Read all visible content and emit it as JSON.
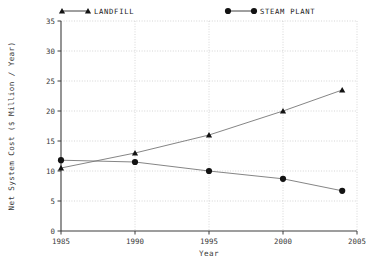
{
  "chart_data": {
    "type": "line",
    "title": "",
    "xlabel": "Year",
    "ylabel": "Net System Cost ($ Million / Year)",
    "x": [
      1985,
      1990,
      1995,
      2000,
      2004
    ],
    "xlim": [
      1985,
      2005
    ],
    "ylim": [
      0,
      35
    ],
    "xticks": [
      "1985",
      "1990",
      "1995",
      "2000",
      "2005"
    ],
    "xtick_values": [
      1985,
      1990,
      1995,
      2000,
      2005
    ],
    "yticks": [
      "0",
      "5",
      "10",
      "15",
      "20",
      "25",
      "30",
      "35"
    ],
    "ytick_values": [
      0,
      5,
      10,
      15,
      20,
      25,
      30,
      35
    ],
    "grid": true,
    "legend_position": "top",
    "series": [
      {
        "name": "LANDFILL",
        "marker": "triangle",
        "values": [
          10.5,
          13.0,
          16.0,
          20.0,
          23.5
        ]
      },
      {
        "name": "STEAM PLANT",
        "marker": "circle",
        "values": [
          11.8,
          11.5,
          10.0,
          8.7,
          6.7
        ]
      }
    ]
  },
  "legend": {
    "entries": [
      {
        "label": "LANDFILL",
        "marker": "triangle-marker-icon"
      },
      {
        "label": "STEAM PLANT",
        "marker": "circle-marker-icon"
      }
    ]
  },
  "axes": {
    "x_title": "Year",
    "y_title": "Net System Cost ($ Million / Year)"
  }
}
